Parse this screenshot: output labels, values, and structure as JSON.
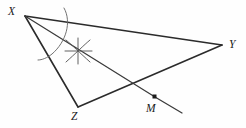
{
  "figure": {
    "kind": "geometry-construction",
    "background_color": "#fefefe",
    "stroke_color": "#2b2b2b",
    "arc_color": "#6a6a6a",
    "labels": {
      "x": "X",
      "y": "Y",
      "z": "Z",
      "m": "M"
    },
    "points": [
      {
        "name": "X",
        "label": "X",
        "x": 25,
        "y": 16
      },
      {
        "name": "Y",
        "label": "Y",
        "x": 222,
        "y": 45
      },
      {
        "name": "Z",
        "label": "Z",
        "x": 78,
        "y": 107
      },
      {
        "name": "M",
        "label": "M",
        "x": 155,
        "y": 97
      }
    ],
    "segments": [
      {
        "name": "side-XY",
        "from": "X",
        "to": "Y"
      },
      {
        "name": "side-XZ",
        "from": "X",
        "to": "Z"
      },
      {
        "name": "side-ZY",
        "from": "Z",
        "to": "Y"
      },
      {
        "name": "bisector-XM",
        "from": "X",
        "to": "M"
      },
      {
        "name": "bisector-extension",
        "from": "M",
        "to": "end"
      }
    ],
    "marks": {
      "vertex_arc": "compass-arc-at-X",
      "intersection_cross": "arc-cross-mark",
      "cross_x": 78,
      "cross_y": 51
    }
  }
}
